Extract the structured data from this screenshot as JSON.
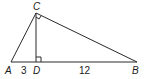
{
  "diagram": {
    "type": "right-triangle-with-altitude",
    "vertices": {
      "A": {
        "label": "A",
        "x": 11,
        "y": 62
      },
      "B": {
        "label": "B",
        "x": 137,
        "y": 62
      },
      "C": {
        "label": "C",
        "x": 36,
        "y": 13
      },
      "D": {
        "label": "D",
        "x": 36,
        "y": 62
      }
    },
    "segments": [
      {
        "from": "A",
        "to": "C"
      },
      {
        "from": "C",
        "to": "B"
      },
      {
        "from": "A",
        "to": "B"
      },
      {
        "from": "C",
        "to": "D"
      }
    ],
    "right_angles": [
      "C",
      "D"
    ],
    "measurements": {
      "AD": "3",
      "DB": "12"
    },
    "colors": {
      "line": "#2a2a2a",
      "background": "#ffffff"
    }
  }
}
